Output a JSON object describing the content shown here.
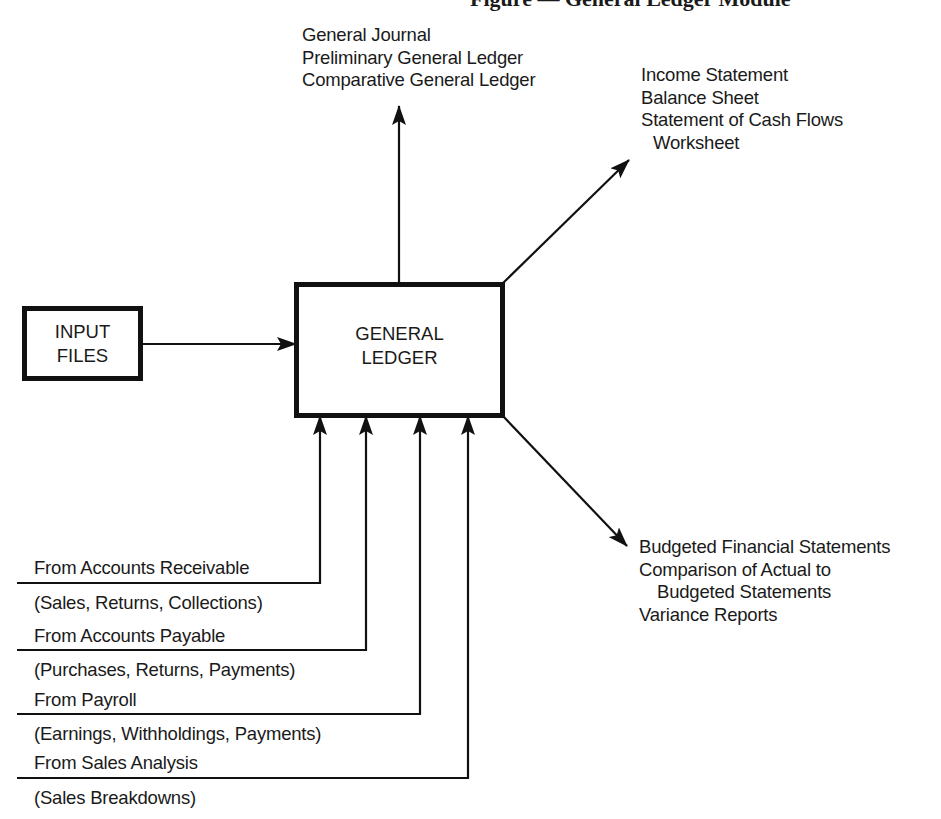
{
  "figure": {
    "title": "Figure — General Ledger Module"
  },
  "nodes": {
    "input_files": {
      "line1": "INPUT",
      "line2": "FILES"
    },
    "general_ledger": {
      "line1": "GENERAL",
      "line2": "LEDGER"
    }
  },
  "outputs": {
    "top": [
      "General Journal",
      "Preliminary General Ledger",
      "Comparative General Ledger"
    ],
    "upper_right": [
      "Income Statement",
      "Balance Sheet",
      "Statement of Cash Flows",
      "Worksheet"
    ],
    "lower_right": [
      "Budgeted Financial Statements",
      "Comparison of Actual to",
      "Budgeted Statements",
      "Variance Reports"
    ]
  },
  "inputs": [
    {
      "source": "From Accounts Receivable",
      "detail": "(Sales, Returns, Collections)"
    },
    {
      "source": "From Accounts Payable",
      "detail": "(Purchases, Returns, Payments)"
    },
    {
      "source": "From Payroll",
      "detail": "(Earnings, Withholdings, Payments)"
    },
    {
      "source": "From Sales Analysis",
      "detail": "(Sales Breakdowns)"
    }
  ],
  "colors": {
    "ink": "#111111",
    "background": "#ffffff"
  }
}
